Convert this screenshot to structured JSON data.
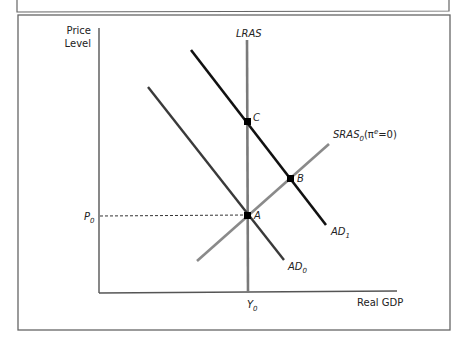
{
  "diagram": {
    "type": "AD-AS model",
    "axes": {
      "y_label_line1": "Price",
      "y_label_line2": "Level",
      "x_label": "Real GDP"
    },
    "curves": {
      "lras": {
        "label": "LRAS"
      },
      "sras": {
        "label": "SRAS",
        "sub": "0",
        "suffix_open": "(π",
        "sup": "e",
        "suffix_close": "=0)"
      },
      "ad0": {
        "label": "AD",
        "sub": "0"
      },
      "ad1": {
        "label": "AD",
        "sub": "1"
      }
    },
    "points": {
      "a": "A",
      "b": "B",
      "c": "C"
    },
    "ticks": {
      "p0": {
        "label": "P",
        "sub": "0"
      },
      "y0": {
        "label": "Y",
        "sub": "0"
      }
    },
    "colors": {
      "ad1": "#111111",
      "ad0": "#3a3a3a",
      "lras": "#7a7a7a",
      "sras": "#8a8a8a",
      "axis": "#555555",
      "frame": "#666666"
    }
  }
}
